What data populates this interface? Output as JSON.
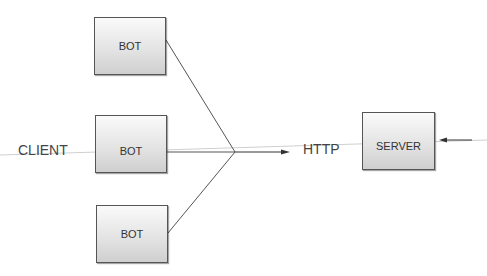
{
  "diagram": {
    "bots": [
      {
        "label": "BOT"
      },
      {
        "label": "BOT"
      },
      {
        "label": "BOT"
      }
    ],
    "client_label": "CLIENT",
    "protocol_label": "HTTP",
    "server_label": "SERVER"
  }
}
